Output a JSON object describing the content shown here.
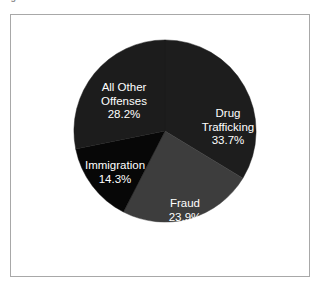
{
  "caption": {
    "fragment": "Figure 1. Offenses"
  },
  "chart_data": {
    "type": "pie",
    "title": "",
    "subtitle": "",
    "xlabel": "",
    "ylabel": "",
    "grid": false,
    "legend_position": "none",
    "labels_inside_slices": true,
    "start_angle_deg": 0,
    "direction": "clockwise",
    "categories": [
      "Drug Trafficking",
      "Fraud",
      "Immigration",
      "All Other Offenses"
    ],
    "values": [
      33.7,
      23.9,
      14.3,
      28.2
    ],
    "value_unit": "%",
    "colors": [
      "#1d1d1d",
      "#3d3d3d",
      "#070707",
      "#1c1c1c"
    ],
    "label_color": "#ffffff",
    "slices": [
      {
        "name": "Drug Trafficking",
        "label_line1": "Drug",
        "label_line2": "Trafficking",
        "value": 33.7,
        "value_text": "33.7%",
        "color": "#1d1d1d"
      },
      {
        "name": "Fraud",
        "label_line1": "Fraud",
        "label_line2": "",
        "value": 23.9,
        "value_text": "23.9%",
        "color": "#3d3d3d"
      },
      {
        "name": "Immigration",
        "label_line1": "Immigration",
        "label_line2": "",
        "value": 14.3,
        "value_text": "14.3%",
        "color": "#070707"
      },
      {
        "name": "All Other Offenses",
        "label_line1": "All Other",
        "label_line2": "Offenses",
        "value": 28.2,
        "value_text": "28.2%",
        "color": "#1c1c1c"
      }
    ]
  },
  "frame": {
    "border_color": "#a8a8a8",
    "background": "#ffffff"
  }
}
